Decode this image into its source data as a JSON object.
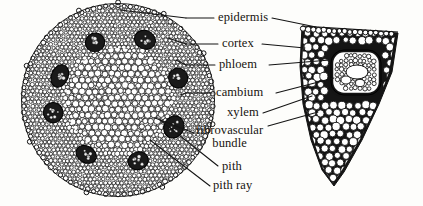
{
  "figure": {
    "ink_color": "#141414",
    "background_color": "#fdfdfb",
    "labels": [
      {
        "id": "epidermis",
        "text": "epidermis",
        "text2": "",
        "x": 218,
        "y": 15
      },
      {
        "id": "cortex",
        "text": "cortex",
        "text2": "",
        "x": 222,
        "y": 41
      },
      {
        "id": "phloem",
        "text": "phloem",
        "text2": "",
        "x": 219,
        "y": 62
      },
      {
        "id": "cambium",
        "text": "cambium",
        "text2": "",
        "x": 216,
        "y": 90
      },
      {
        "id": "xylem",
        "text": "xylem",
        "text2": "",
        "x": 227,
        "y": 110
      },
      {
        "id": "fibrovascular",
        "text": "fibrovascular",
        "text2": "bundle",
        "x": 196,
        "y": 130
      },
      {
        "id": "pith",
        "text": "pith",
        "text2": "",
        "x": 222,
        "y": 166
      },
      {
        "id": "pith-ray",
        "text": "pith ray",
        "text2": "",
        "x": 213,
        "y": 185
      }
    ],
    "parts": {
      "cross_section": "stem cross section",
      "magnified_wedge": "magnified sector of stem"
    }
  }
}
